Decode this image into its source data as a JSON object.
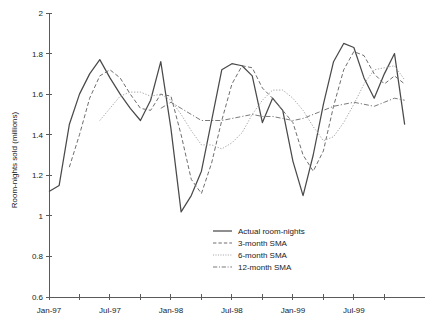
{
  "chart_data": {
    "type": "line",
    "title": "",
    "xlabel": "",
    "ylabel": "Room-nights sold (millions)",
    "ylim": [
      0.6,
      2
    ],
    "ytick_labels": [
      "0.6",
      "0.8",
      "1",
      "1.2",
      "1.4",
      "1.6",
      "1.8",
      "2"
    ],
    "ytick_values": [
      0.6,
      0.8,
      1.0,
      1.2,
      1.4,
      1.6,
      1.8,
      2.0
    ],
    "xtick_labels": [
      "Jan-97",
      "Jul-97",
      "Jan-98",
      "Jul-98",
      "Jan-99",
      "Jul-99"
    ],
    "xtick_label_indices": [
      0,
      6,
      12,
      18,
      24,
      30
    ],
    "xtick_minor_indices": [
      0,
      3,
      6,
      9,
      12,
      15,
      18,
      21,
      24,
      27,
      30,
      33
    ],
    "x": [
      "Jan-97",
      "Feb-97",
      "Mar-97",
      "Apr-97",
      "May-97",
      "Jun-97",
      "Jul-97",
      "Aug-97",
      "Sep-97",
      "Oct-97",
      "Nov-97",
      "Dec-97",
      "Jan-98",
      "Feb-98",
      "Mar-98",
      "Apr-98",
      "May-98",
      "Jun-98",
      "Jul-98",
      "Aug-98",
      "Sep-98",
      "Oct-98",
      "Nov-98",
      "Dec-98",
      "Jan-99",
      "Feb-99",
      "Mar-99",
      "Apr-99",
      "May-99",
      "Jun-99",
      "Jul-99",
      "Aug-99",
      "Sep-99",
      "Oct-99",
      "Nov-99",
      "Dec-99"
    ],
    "grid": false,
    "legend_position": "inside-lower-center",
    "series": [
      {
        "name": "Actual room-nights",
        "style": "solid",
        "color": "#4a4a4a",
        "values": [
          1.12,
          1.15,
          1.45,
          1.6,
          1.7,
          1.77,
          1.68,
          1.6,
          1.53,
          1.47,
          1.57,
          1.76,
          1.43,
          1.02,
          1.1,
          1.22,
          1.47,
          1.72,
          1.75,
          1.74,
          1.69,
          1.46,
          1.58,
          1.52,
          1.27,
          1.1,
          1.3,
          1.55,
          1.76,
          1.85,
          1.83,
          1.68,
          1.58,
          1.7,
          1.8,
          1.45
        ]
      },
      {
        "name": "3-month SMA",
        "style": "dashed",
        "color": "#6e6e6e",
        "values": [
          null,
          null,
          1.24,
          1.4,
          1.58,
          1.69,
          1.72,
          1.68,
          1.6,
          1.53,
          1.52,
          1.6,
          1.59,
          1.4,
          1.18,
          1.11,
          1.26,
          1.47,
          1.65,
          1.74,
          1.73,
          1.63,
          1.58,
          1.52,
          1.46,
          1.3,
          1.22,
          1.32,
          1.54,
          1.72,
          1.81,
          1.79,
          1.7,
          1.65,
          1.69,
          1.65
        ]
      },
      {
        "name": "6-month SMA",
        "style": "dotted",
        "color": "#a8a8a8",
        "values": [
          null,
          null,
          null,
          null,
          null,
          1.47,
          1.53,
          1.59,
          1.61,
          1.61,
          1.59,
          1.6,
          1.57,
          1.5,
          1.42,
          1.35,
          1.35,
          1.33,
          1.36,
          1.41,
          1.5,
          1.57,
          1.62,
          1.62,
          1.58,
          1.52,
          1.44,
          1.37,
          1.39,
          1.46,
          1.55,
          1.65,
          1.72,
          1.73,
          1.74,
          1.67
        ]
      },
      {
        "name": "12-month SMA",
        "style": "dashdot",
        "color": "#7a7a7a",
        "values": [
          null,
          null,
          null,
          null,
          null,
          null,
          null,
          null,
          null,
          null,
          null,
          1.53,
          1.56,
          1.53,
          1.5,
          1.47,
          1.47,
          1.47,
          1.48,
          1.49,
          1.5,
          1.49,
          1.49,
          1.48,
          1.47,
          1.48,
          1.5,
          1.52,
          1.54,
          1.55,
          1.56,
          1.55,
          1.54,
          1.56,
          1.58,
          1.57
        ]
      }
    ]
  },
  "legend": {
    "items": [
      {
        "label": "Actual room-nights"
      },
      {
        "label": "3-month SMA"
      },
      {
        "label": "6-month SMA"
      },
      {
        "label": "12-month SMA"
      }
    ]
  },
  "axes": {
    "y_title": "Room-nights sold (millions)"
  }
}
